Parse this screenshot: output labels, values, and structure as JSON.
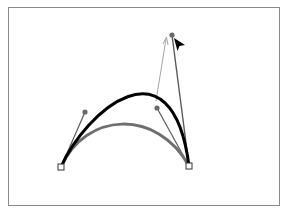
{
  "diagram": {
    "colors": {
      "frame": "#8a8a8a",
      "original_curve": "#6e6e6e",
      "adjusted_curve": "#000000",
      "handle_line": "#5a5a5a",
      "drag_guide": "#9a9a9a",
      "handle_dot": "#6a6a6a",
      "anchor_fill": "#ffffff",
      "anchor_stroke": "#333333",
      "cursor": "#000000"
    },
    "elements": [
      {
        "name": "anchor-point-left",
        "type": "anchor"
      },
      {
        "name": "anchor-point-right",
        "type": "anchor"
      },
      {
        "name": "original-curve",
        "type": "curve",
        "state": "before"
      },
      {
        "name": "adjusted-curve",
        "type": "curve",
        "state": "after"
      },
      {
        "name": "left-direction-handle",
        "type": "handle"
      },
      {
        "name": "original-right-handle",
        "type": "handle"
      },
      {
        "name": "dragged-right-handle",
        "type": "handle"
      },
      {
        "name": "drag-direction-arrow",
        "type": "arrow"
      },
      {
        "name": "selection-cursor",
        "type": "icon",
        "icon": "arrow-pointer-icon"
      }
    ]
  }
}
